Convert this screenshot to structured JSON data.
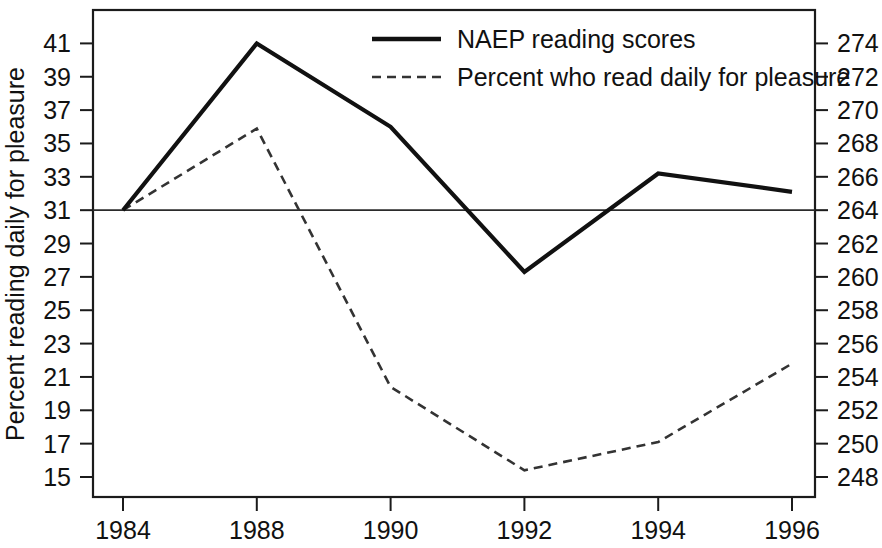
{
  "chart_data": {
    "type": "line",
    "title": "",
    "xlabel": "",
    "ylabel": "Percent reading daily for pleasure",
    "ylabel_right": "",
    "categories": [
      "1984",
      "1988",
      "1990",
      "1992",
      "1994",
      "1996"
    ],
    "x_tick_labels": [
      "1984",
      "1988",
      "1990",
      "1992",
      "1994",
      "1996"
    ],
    "grid": false,
    "legend_position": "top-center",
    "axes": {
      "left": {
        "ylim": [
          15,
          41
        ],
        "tick_step": 2,
        "ticks": [
          15,
          17,
          19,
          21,
          23,
          25,
          27,
          29,
          31,
          33,
          35,
          37,
          39,
          41
        ],
        "tick_labels": [
          "15",
          "17",
          "19",
          "21",
          "23",
          "25",
          "27",
          "29",
          "31",
          "33",
          "35",
          "37",
          "39",
          "41"
        ],
        "title": "Percent reading daily for pleasure"
      },
      "right": {
        "ylim": [
          248,
          274
        ],
        "tick_step": 2,
        "ticks": [
          248,
          250,
          252,
          254,
          256,
          258,
          260,
          262,
          264,
          266,
          268,
          270,
          272,
          274
        ],
        "tick_labels": [
          "248",
          "250",
          "252",
          "254",
          "256",
          "258",
          "260",
          "262",
          "264",
          "266",
          "268",
          "270",
          "272",
          "274"
        ],
        "title": ""
      }
    },
    "reference_line": {
      "left_value": 31,
      "right_value": 264,
      "style": "solid-horizontal"
    },
    "series": [
      {
        "name": "NAEP reading scores",
        "axis": "right",
        "style": "solid",
        "color": "#111111",
        "values": [
          264.0,
          274.0,
          269.0,
          260.3,
          266.2,
          265.1
        ],
        "values_left_scale": [
          31.0,
          41.0,
          36.0,
          27.4,
          33.2,
          32.1
        ]
      },
      {
        "name": "Percent who read daily for pleasure",
        "axis": "left",
        "style": "dashed",
        "color": "#333333",
        "values": [
          31.0,
          35.9,
          20.4,
          15.4,
          17.1,
          21.8
        ]
      }
    ],
    "legend": [
      {
        "label": "NAEP reading scores",
        "style": "solid"
      },
      {
        "label": "Percent who read daily for pleasure",
        "style": "dashed"
      }
    ]
  }
}
